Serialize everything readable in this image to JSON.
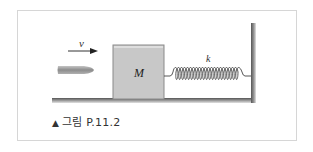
{
  "figure": {
    "caption_marker": "▲",
    "caption_text": "그림 P.11.2",
    "labels": {
      "velocity": "v",
      "mass": "M",
      "spring_constant": "k"
    },
    "colors": {
      "block_fill": "#c8c8c8",
      "block_edge": "#8a8a8a",
      "floor": "#7a7a7a",
      "wall": "#6e6e6e",
      "bullet": "#9a9a9a",
      "frame_border": "#d6d6d6"
    }
  }
}
